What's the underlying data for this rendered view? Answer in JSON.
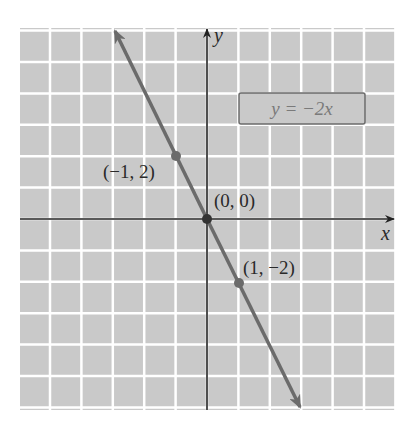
{
  "chart_data": {
    "type": "line",
    "title": "",
    "xlabel": "x",
    "ylabel": "y",
    "xlim": [
      -6,
      6
    ],
    "ylim": [
      -6,
      6
    ],
    "grid": true,
    "series": [
      {
        "name": "y = -2x",
        "equation": "y = -2x",
        "slope": -2,
        "intercept": 0,
        "x": [
          -2.9,
          2.9
        ],
        "y": [
          5.8,
          -5.8
        ]
      }
    ],
    "points": [
      {
        "x": -1,
        "y": 2,
        "label": "(−1, 2)"
      },
      {
        "x": 0,
        "y": 0,
        "label": "(0, 0)"
      },
      {
        "x": 1,
        "y": -2,
        "label": "(1, −2)"
      }
    ],
    "legend": {
      "text": "y = −2x",
      "position": "upper right"
    }
  },
  "colors": {
    "grid_bg": "#c9c9c9",
    "grid_line": "#ffffff",
    "axis": "#222222",
    "line": "#6b6b6b",
    "point": "#6b6b6b",
    "legend_border": "#6b6b6b",
    "legend_text": "#7a7a7a"
  },
  "labels": {
    "x_axis": "x",
    "y_axis": "y",
    "p1": "(−1, 2)",
    "p2": "(0, 0)",
    "p3": "(1, −2)",
    "legend": "y = −2x"
  }
}
